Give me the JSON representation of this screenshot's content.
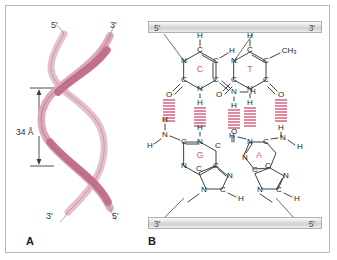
{
  "figure": {
    "panels": [
      {
        "id": "A",
        "letter": "A",
        "name": "dna-double-helix",
        "labels": {
          "top_left_prime": "5'",
          "top_right_prime": "3'",
          "bottom_left_prime": "3'",
          "bottom_right_prime": "5'",
          "dimension": "34 Å"
        },
        "colors": {
          "strand_front": "#c4708a",
          "strand_back": "#e6bcc8",
          "outline": "#8a7782"
        }
      },
      {
        "id": "B",
        "letter": "B",
        "name": "base-pair-hydrogen-bonding",
        "backbone": {
          "top_left_prime": "5'",
          "top_right_prime": "3'",
          "bottom_left_prime": "3'",
          "bottom_right_prime": "5'"
        },
        "base_pairs": [
          {
            "name": "cytosine-guanine-pair",
            "top_base": "C",
            "top_base_name": "cytosine",
            "bottom_base": "G",
            "bottom_base_name": "guanine",
            "hydrogen_bonds": 3
          },
          {
            "name": "thymine-adenine-pair",
            "top_base": "T",
            "top_base_name": "thymine",
            "bottom_base": "A",
            "bottom_base_name": "adenine",
            "hydrogen_bonds": 2,
            "methyl_label": "CH",
            "methyl_sub": "3"
          }
        ],
        "atoms": {
          "nitrogen": "N",
          "carbon": "C",
          "oxygen": "O",
          "hydrogen": "H"
        },
        "colors": {
          "hydrogen_bond": "#c8345a",
          "base_letter": "#cf5f77",
          "bond": "#1d1d1d",
          "backbone_bar": "#d0d0d0"
        }
      }
    ],
    "border_color": "#b9b9b9",
    "background": "#ffffff"
  }
}
